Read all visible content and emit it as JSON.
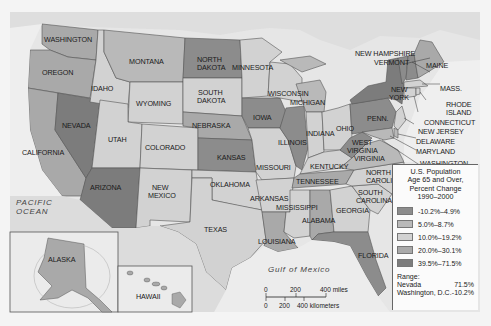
{
  "legend": {
    "title_lines": [
      "U.S. Population",
      "Age 65 and Over,",
      "Percent Change",
      "1990–2000"
    ],
    "classes": [
      {
        "label": "-10.2%–4.9%",
        "color": "#8c8c8c"
      },
      {
        "label": "5.0%–8.7%",
        "color": "#b9b9b9"
      },
      {
        "label": "10.0%–19.2%",
        "color": "#d2d2d2"
      },
      {
        "label": "20.0%–30.1%",
        "color": "#a9a9a9"
      },
      {
        "label": "39.5%–71.5%",
        "color": "#7c7c7c"
      }
    ],
    "range_label": "Range:",
    "range": [
      {
        "name": "Nevada",
        "value": "71.5%"
      },
      {
        "name": "Washington, D.C.",
        "value": "-10.2%"
      }
    ]
  },
  "water": {
    "pacific_1": "PACIFIC",
    "pacific_2": "OCEAN",
    "gulf": "Gulf of Mexico"
  },
  "scale": {
    "miles": [
      "0",
      "200",
      "400 miles"
    ],
    "km": [
      "0",
      "200",
      "400 kilometers"
    ]
  },
  "states": {
    "washington": "WASHINGTON",
    "oregon": "OREGON",
    "california": "CALIFORNIA",
    "nevada": "NEVADA",
    "idaho": "IDAHO",
    "montana": "MONTANA",
    "wyoming": "WYOMING",
    "utah": "UTAH",
    "colorado": "COLORADO",
    "arizona": "ARIZONA",
    "new_mexico_1": "NEW",
    "new_mexico_2": "MEXICO",
    "north_dakota_1": "NORTH",
    "north_dakota_2": "DAKOTA",
    "south_dakota_1": "SOUTH",
    "south_dakota_2": "DAKOTA",
    "nebraska": "NEBRASKA",
    "kansas": "KANSAS",
    "oklahoma": "OKLAHOMA",
    "texas": "TEXAS",
    "minnesota": "MINNESOTA",
    "iowa": "IOWA",
    "missouri": "MISSOURI",
    "arkansas": "ARKANSAS",
    "louisiana": "LOUISIANA",
    "wisconsin": "WISCONSIN",
    "illinois": "ILLINOIS",
    "michigan": "MICHIGAN",
    "indiana": "INDIANA",
    "ohio": "OHIO",
    "kentucky": "KENTUCKY",
    "tennessee": "TENNESSEE",
    "mississippi": "MISSISSIPPI",
    "alabama": "ALABAMA",
    "georgia": "GEORGIA",
    "florida": "FLORIDA",
    "south_carolina_1": "SOUTH",
    "south_carolina_2": "CAROLINA",
    "north_carolina_1": "NORTH",
    "north_carolina_2": "CAROLINA",
    "virginia": "VIRGINIA",
    "west_virginia_1": "WEST",
    "west_virginia_2": "VIRGINIA",
    "penn": "PENN.",
    "new_york_1": "NEW",
    "new_york_2": "YORK",
    "maine": "MAINE",
    "new_hampshire": "NEW HAMPSHIRE",
    "vermont": "VERMONT",
    "mass": "MASS.",
    "rhode_island_1": "RHODE",
    "rhode_island_2": "ISLAND",
    "connecticut": "CONNECTICUT",
    "new_jersey": "NEW JERSEY",
    "delaware": "DELAWARE",
    "maryland": "MARYLAND",
    "dc_1": "WASHINGTON,",
    "dc_2": "D.C.",
    "alaska": "ALASKA",
    "hawaii": "HAWAII"
  }
}
